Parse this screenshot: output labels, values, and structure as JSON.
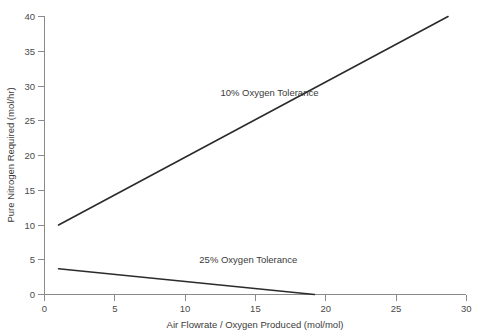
{
  "chart_data": {
    "type": "line",
    "title": "",
    "xlabel": "Air Flowrate / Oxygen Produced (mol/mol)",
    "ylabel": "Pure Nitrogen Required (mol/hr)",
    "xlim": [
      0,
      30
    ],
    "ylim": [
      0,
      40
    ],
    "xticks": [
      0,
      5,
      10,
      15,
      20,
      25,
      30
    ],
    "yticks": [
      0,
      5,
      10,
      15,
      20,
      25,
      30,
      35,
      40
    ],
    "xtick_labels": [
      "0",
      "5",
      "10",
      "15",
      "20",
      "25",
      "30"
    ],
    "ytick_labels": [
      "0",
      "5",
      "10",
      "15",
      "20",
      "25",
      "30",
      "35",
      "40"
    ],
    "grid": false,
    "legend_position": "inline-annotations",
    "line_color": "#2b2b2b",
    "axis_color": "#8a8a8a",
    "background_color": "#ffffff",
    "series": [
      {
        "name": "10% Oxygen Tolerance",
        "annotation": "10% Oxygen Tolerance",
        "annotation_x": 16.0,
        "annotation_y": 28.5,
        "x": [
          1,
          28.7
        ],
        "values": [
          10,
          40
        ]
      },
      {
        "name": "25% Oxygen Tolerance",
        "annotation": "25% Oxygen Tolerance",
        "annotation_x": 14.5,
        "annotation_y": 4.6,
        "x": [
          1,
          19.2
        ],
        "values": [
          3.7,
          0
        ]
      }
    ]
  }
}
